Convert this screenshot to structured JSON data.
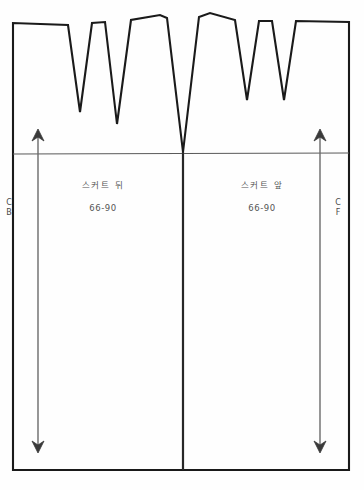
{
  "document": {
    "title": "Skirt Pattern Draft",
    "type": "sewing-pattern-diagram",
    "background_color": "#fefefe",
    "line_color": "#1a1a1a",
    "text_color": "#4a4a4a"
  },
  "panels": {
    "back": {
      "title": "스커트 뒤",
      "size": "66-90",
      "marker_line1": "C",
      "marker_line2": "B",
      "marker_meaning": "Center Back"
    },
    "front": {
      "title": "스커트 앞",
      "size": "66-90",
      "marker_line1": "C",
      "marker_line2": "F",
      "marker_meaning": "Center Front"
    }
  },
  "geometry": {
    "frame": {
      "left": 13,
      "right": 349,
      "top": 22,
      "bottom": 470
    },
    "center_seam_x": 183,
    "hip_line_y": 154,
    "back_darts": [
      {
        "left_x": 68,
        "right_x": 92,
        "apex_x": 80,
        "apex_y": 112
      },
      {
        "left_x": 105,
        "right_x": 131,
        "apex_x": 117,
        "apex_y": 124
      }
    ],
    "front_darts": [
      {
        "left_x": 235,
        "right_x": 259,
        "apex_x": 247,
        "apex_y": 100
      },
      {
        "left_x": 272,
        "right_x": 296,
        "apex_x": 284,
        "apex_y": 100
      }
    ],
    "center_dart": {
      "left_x": 167,
      "right_x": 199,
      "apex_x": 183,
      "apex_y": 152
    },
    "grainlines": [
      {
        "x": 38,
        "top_y": 130,
        "bottom_y": 452
      },
      {
        "x": 320,
        "top_y": 130,
        "bottom_y": 452
      }
    ]
  },
  "icons": {
    "grainline": "double-arrow-vertical-icon"
  }
}
